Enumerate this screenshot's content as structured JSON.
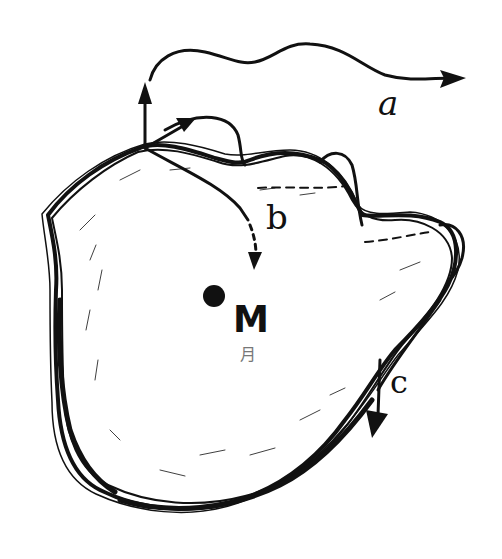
{
  "diagram": {
    "type": "hand-drawn sketch",
    "labels": {
      "a": "a",
      "b": "b",
      "c": "c",
      "center": "M",
      "center_caption": "月"
    },
    "paths": [
      {
        "id": "a",
        "description": "Arrow rising from the top-left of the body, looping up and flying off to the right"
      },
      {
        "id": "b",
        "description": "Arrow curving from the top-left edge down into the body (dashed end)"
      },
      {
        "id": "c",
        "description": "Short arrow pointing downward from the right side of the body"
      }
    ],
    "colors": {
      "ink": "#111111",
      "background": "#ffffff",
      "caption": "#777777"
    }
  }
}
